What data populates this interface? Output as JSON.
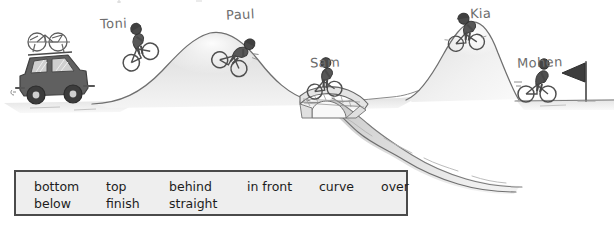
{
  "illustration": {
    "title": "bike-race-scene",
    "description": "Hand-drawn cycling race scene with hills, bridge, river and finish flag",
    "colors": {
      "pencil_line": "#6b6b6b",
      "hill_shade": "#d5d5d5",
      "ground_shade": "#dcdcdc",
      "figure_dark": "#4a4a4a",
      "car_body": "#5c5c5c",
      "water": "#b9b9b9",
      "flag_dark": "#3a3a3a",
      "box_fill": "#eeeeee",
      "box_border": "#4a4a4a",
      "label_text": "#6d6d6d",
      "word_text": "#1c1c1c"
    },
    "labels": {
      "toni": "Toni",
      "paul": "Paul",
      "sam": "Sam",
      "kia": "Kia",
      "mohen": "Mohen"
    },
    "objects": {
      "car": "car-with-roof-bike-rack",
      "bridge": "stone-arch-bridge",
      "river": "winding-river",
      "flag": "finish-flag",
      "hill_left": "large-hill",
      "hill_right": "steep-hill"
    }
  },
  "word_bank": {
    "rows": [
      {
        "words": [
          {
            "text": "bottom"
          },
          {
            "text": "top"
          },
          {
            "text": "behind"
          },
          {
            "text": "in front"
          },
          {
            "text": "curve"
          },
          {
            "text": "over"
          }
        ]
      },
      {
        "words": [
          {
            "text": "below"
          },
          {
            "text": "finish"
          },
          {
            "text": "straight"
          }
        ]
      }
    ]
  }
}
